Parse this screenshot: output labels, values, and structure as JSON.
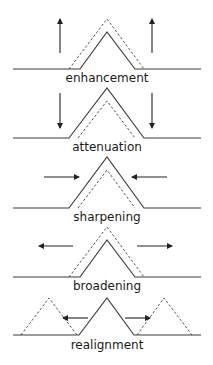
{
  "panels": [
    {
      "label": "enhancement",
      "description": "dashed peak taller than solid; arrows pointing up"
    },
    {
      "label": "attenuation",
      "description": "dashed peak shorter than solid; arrows pointing down"
    },
    {
      "label": "sharpening",
      "description": "dashed peak narrower than solid; arrows pointing inward"
    },
    {
      "label": "broadening",
      "description": "dashed peak wider than solid; arrows pointing outward"
    },
    {
      "label": "realignment",
      "description": "dashed peaks shifted left and right of solid peak; arrows pointing outward"
    }
  ],
  "colors": {
    "line": "#3a3a3a",
    "dashed": "#555555",
    "text": "#1a1a1a",
    "background": "#ffffff"
  }
}
